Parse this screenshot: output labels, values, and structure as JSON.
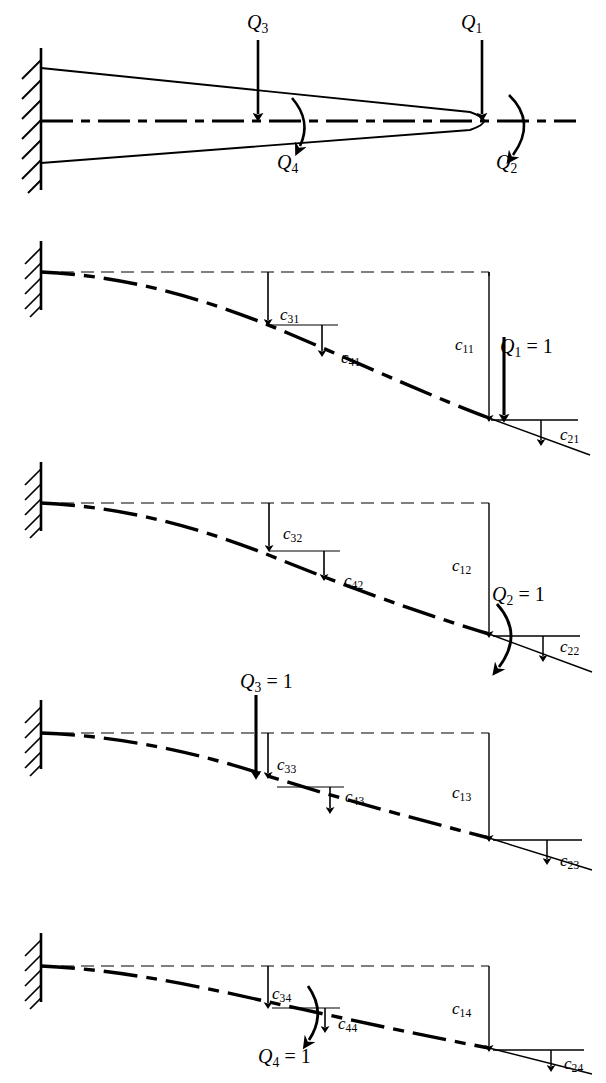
{
  "figure": {
    "type": "engineering-diagram",
    "panel_count": 5
  },
  "panels": [
    {
      "id": "panel-generalized-forces",
      "index": 1,
      "description": "Tapered cantilever beam fixed at left wall with four generalized forces",
      "labels": [
        {
          "id": "Q3",
          "base": "Q",
          "sub": "3",
          "eq": "",
          "x": 247,
          "y": 12,
          "kind": "force-label"
        },
        {
          "id": "Q1",
          "base": "Q",
          "sub": "1",
          "eq": "",
          "x": 461,
          "y": 12,
          "kind": "force-label"
        },
        {
          "id": "Q4",
          "base": "Q",
          "sub": "4",
          "eq": "",
          "x": 277,
          "y": 152,
          "kind": "moment-label"
        },
        {
          "id": "Q2",
          "base": "Q",
          "sub": "2",
          "eq": "",
          "x": 496,
          "y": 152,
          "kind": "moment-label"
        }
      ]
    },
    {
      "id": "panel-c-col-1",
      "index": 2,
      "description": "Deflected shape for unit load Q1 = 1 at the free end",
      "labels": [
        {
          "id": "c31",
          "base": "c",
          "sub": "31",
          "eq": "",
          "x": 280,
          "y": 306,
          "kind": "deflection-label"
        },
        {
          "id": "c41",
          "base": "c",
          "sub": "41",
          "eq": "",
          "x": 341,
          "y": 349,
          "kind": "rotation-label"
        },
        {
          "id": "c11",
          "base": "c",
          "sub": "11",
          "eq": "",
          "x": 455,
          "y": 336,
          "kind": "deflection-label"
        },
        {
          "id": "Q1eq1",
          "base": "Q",
          "sub": "1",
          "eq": " = 1",
          "x": 500,
          "y": 336,
          "kind": "unit-load-label"
        },
        {
          "id": "c21",
          "base": "c",
          "sub": "21",
          "eq": "",
          "x": 560,
          "y": 426,
          "kind": "rotation-label"
        }
      ]
    },
    {
      "id": "panel-c-col-2",
      "index": 3,
      "description": "Deflected shape for unit moment Q2 = 1 at the free end",
      "labels": [
        {
          "id": "c32",
          "base": "c",
          "sub": "32",
          "eq": "",
          "x": 283,
          "y": 525,
          "kind": "deflection-label"
        },
        {
          "id": "c42",
          "base": "c",
          "sub": "42",
          "eq": "",
          "x": 344,
          "y": 572,
          "kind": "rotation-label"
        },
        {
          "id": "c12",
          "base": "c",
          "sub": "12",
          "eq": "",
          "x": 452,
          "y": 557,
          "kind": "deflection-label"
        },
        {
          "id": "Q2eq1",
          "base": "Q",
          "sub": "2",
          "eq": " = 1",
          "x": 492,
          "y": 584,
          "kind": "unit-moment-label"
        },
        {
          "id": "c22",
          "base": "c",
          "sub": "22",
          "eq": "",
          "x": 560,
          "y": 638,
          "kind": "rotation-label"
        }
      ]
    },
    {
      "id": "panel-c-col-3",
      "index": 4,
      "description": "Deflected shape for unit load Q3 = 1 at the interior station",
      "labels": [
        {
          "id": "Q3eq1",
          "base": "Q",
          "sub": "3",
          "eq": " = 1",
          "x": 240,
          "y": 671,
          "kind": "unit-load-label"
        },
        {
          "id": "c33",
          "base": "c",
          "sub": "33",
          "eq": "",
          "x": 277,
          "y": 756,
          "kind": "deflection-label"
        },
        {
          "id": "c43",
          "base": "c",
          "sub": "43",
          "eq": "",
          "x": 345,
          "y": 788,
          "kind": "rotation-label"
        },
        {
          "id": "c13",
          "base": "c",
          "sub": "13",
          "eq": "",
          "x": 452,
          "y": 784,
          "kind": "deflection-label"
        },
        {
          "id": "c23",
          "base": "c",
          "sub": "23",
          "eq": "",
          "x": 560,
          "y": 852,
          "kind": "rotation-label"
        }
      ]
    },
    {
      "id": "panel-c-col-4",
      "index": 5,
      "description": "Deflected shape for unit moment Q4 = 1 at the interior station",
      "labels": [
        {
          "id": "c34",
          "base": "c",
          "sub": "34",
          "eq": "",
          "x": 272,
          "y": 985,
          "kind": "deflection-label"
        },
        {
          "id": "c44",
          "base": "c",
          "sub": "44",
          "eq": "",
          "x": 338,
          "y": 1015,
          "kind": "rotation-label"
        },
        {
          "id": "c14",
          "base": "c",
          "sub": "14",
          "eq": "",
          "x": 452,
          "y": 1000,
          "kind": "deflection-label"
        },
        {
          "id": "Q4eq1",
          "base": "Q",
          "sub": "4",
          "eq": " = 1",
          "x": 258,
          "y": 1046,
          "kind": "unit-moment-label"
        },
        {
          "id": "c24",
          "base": "c",
          "sub": "24",
          "eq": "",
          "x": 564,
          "y": 1055,
          "kind": "rotation-label"
        }
      ]
    }
  ],
  "style": {
    "ink": "#000000",
    "paper": "#ffffff",
    "thin_stroke": 1.1,
    "thick_stroke": 3.4,
    "dashdot_pattern": "22 7 7 7"
  }
}
